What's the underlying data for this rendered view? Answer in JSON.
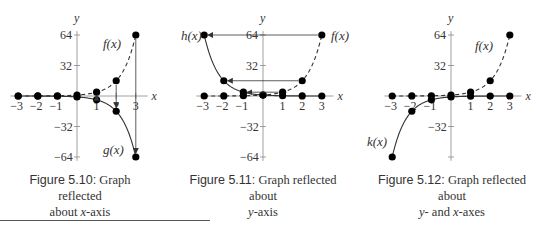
{
  "figures": [
    {
      "number": "Figure 5.10:",
      "caption_line1": " Graph reflected",
      "caption_line2_pre": "about ",
      "caption_line2_var": "x",
      "caption_line2_post": "-axis",
      "axis_x_label": "x",
      "axis_y_label": "y",
      "curve_labels": [
        "f(x)",
        "g(x)"
      ]
    },
    {
      "number": "Figure 5.11:",
      "caption_line1": " Graph reflected about",
      "caption_line2_pre": "",
      "caption_line2_var": "y",
      "caption_line2_post": "-axis",
      "axis_x_label": "x",
      "axis_y_label": "y",
      "curve_labels": [
        "h(x)",
        "f(x)"
      ]
    },
    {
      "number": "Figure 5.12:",
      "caption_line1": " Graph reflected about",
      "caption_line2_pre": "",
      "caption_line2_var": "y",
      "caption_line2_post": "- and ",
      "caption_line2_var2": "x",
      "caption_line2_post2": "-axes",
      "axis_x_label": "x",
      "axis_y_label": "y",
      "curve_labels": [
        "f(x)",
        "k(x)"
      ]
    }
  ],
  "chart_data": [
    {
      "type": "line",
      "title": "Figure 5.10: Graph reflected about x-axis",
      "xlabel": "x",
      "ylabel": "y",
      "xlim": [
        -3,
        3
      ],
      "ylim": [
        -64,
        64
      ],
      "xticks": [
        "-3",
        "-2",
        "-1",
        "1",
        "2",
        "3"
      ],
      "yticks": [
        "64",
        "32",
        "-32",
        "-64"
      ],
      "x": [
        -3,
        -2,
        -1,
        0,
        1,
        2,
        3
      ],
      "series": [
        {
          "name": "f(x)",
          "style": "dashed",
          "values": [
            0.0156,
            0.0625,
            0.25,
            1,
            4,
            16,
            64
          ]
        },
        {
          "name": "g(x)",
          "style": "solid",
          "values": [
            -0.0156,
            -0.0625,
            -0.25,
            -1,
            -4,
            -16,
            -64
          ]
        }
      ],
      "note": "Vertical arrows from f(x) points to g(x) points at x=1,2,3"
    },
    {
      "type": "line",
      "title": "Figure 5.11: Graph reflected about y-axis",
      "xlabel": "x",
      "ylabel": "y",
      "xlim": [
        -3,
        3
      ],
      "ylim": [
        -64,
        64
      ],
      "xticks": [
        "-3",
        "-2",
        "-1",
        "1",
        "2",
        "3"
      ],
      "yticks": [
        "64",
        "32",
        "-32",
        "-64"
      ],
      "x": [
        -3,
        -2,
        -1,
        0,
        1,
        2,
        3
      ],
      "series": [
        {
          "name": "f(x)",
          "style": "dashed",
          "values": [
            0.0156,
            0.0625,
            0.25,
            1,
            4,
            16,
            64
          ]
        },
        {
          "name": "h(x)",
          "style": "solid",
          "values": [
            64,
            16,
            4,
            1,
            0.25,
            0.0625,
            0.0156
          ]
        }
      ],
      "note": "Horizontal arrows from f(x) points to h(x) points at y=64,16,4"
    },
    {
      "type": "line",
      "title": "Figure 5.12: Graph reflected about y- and x-axes",
      "xlabel": "x",
      "ylabel": "y",
      "xlim": [
        -3,
        3
      ],
      "ylim": [
        -64,
        64
      ],
      "xticks": [
        "-3",
        "-2",
        "-1",
        "1",
        "2",
        "3"
      ],
      "yticks": [
        "64",
        "32",
        "-32"
      ],
      "x": [
        -3,
        -2,
        -1,
        0,
        1,
        2,
        3
      ],
      "series": [
        {
          "name": "f(x)",
          "style": "dashed",
          "values": [
            0.0156,
            0.0625,
            0.25,
            1,
            4,
            16,
            64
          ]
        },
        {
          "name": "k(x)",
          "style": "solid",
          "values": [
            -64,
            -16,
            -4,
            -1,
            -0.25,
            -0.0625,
            -0.0156
          ]
        }
      ]
    }
  ]
}
